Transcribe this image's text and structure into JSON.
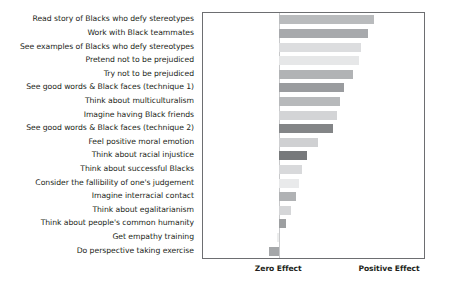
{
  "chart_data": {
    "type": "bar",
    "orientation": "horizontal",
    "title": "",
    "xlabel": "",
    "ylabel": "",
    "grid": false,
    "legend": null,
    "axis_annotations": {
      "zero": "Zero Effect",
      "positive": "Positive Effect"
    },
    "xlim": [
      -0.345,
      0.655
    ],
    "zero_reference": 0,
    "categories": [
      "Read story of Blacks who defy stereotypes",
      "Work with Black teammates",
      "See examples of Blacks who defy stereotypes",
      "Pretend not to be prejudiced",
      "Try not to be prejudiced",
      "See good words & Black faces (technique 1)",
      "Think about multiculturalism",
      "Imagine having Black friends",
      "See good words & Black faces (technique 2)",
      "Feel positive moral emotion",
      "Think about racial injustice",
      "Think about successful Blacks",
      "Consider the fallibility of one's judgement",
      "Imagine interracial contact",
      "Think about egalitarianism",
      "Think about people's common humanity",
      "Get empathy training",
      "Do perspective taking exercise"
    ],
    "values": [
      0.43,
      0.4,
      0.37,
      0.36,
      0.335,
      0.295,
      0.275,
      0.26,
      0.245,
      0.175,
      0.125,
      0.105,
      0.09,
      0.075,
      0.055,
      0.03,
      -0.01,
      -0.045
    ],
    "bar_colors": [
      "#b9bbbd",
      "#a7a9ac",
      "#dcdddf",
      "#e6e7e8",
      "#b1b3b5",
      "#9a9c9f",
      "#b7b9bb",
      "#d3d4d6",
      "#838587",
      "#cfd0d2",
      "#77797b",
      "#d8d9db",
      "#e9eaeb",
      "#b0b2b4",
      "#d5d6d8",
      "#9d9fa1",
      "#eceded",
      "#a5a7a9",
      "#8a8c8e"
    ]
  }
}
